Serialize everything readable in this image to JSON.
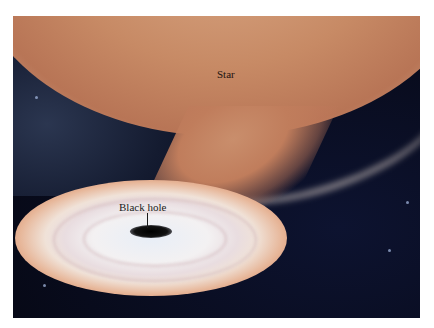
{
  "figure": {
    "labels": {
      "star": "Star",
      "black_hole": "Black hole"
    },
    "colors": {
      "star": "#c78a65",
      "space": "#080b1c",
      "disk_inner": "#eef2f7",
      "disk_outer": "#d78f6e",
      "black_hole": "#000000"
    }
  }
}
